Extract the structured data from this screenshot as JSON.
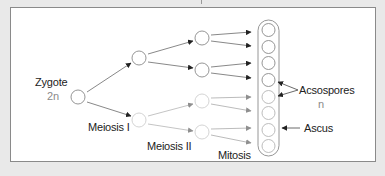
{
  "diagram": {
    "labels": {
      "zygote": "Zygote",
      "zygote_ploidy": "2n",
      "meiosis1": "Meiosis I",
      "meiosis2": "Meiosis II",
      "mitosis": "Mitosis",
      "ascospores": "Acsospores",
      "ascospores_ploidy": "n",
      "ascus": "Ascus"
    },
    "nodes": {
      "zygote": {
        "x": 78,
        "y": 97
      },
      "meiosis1": [
        {
          "x": 139,
          "y": 58
        },
        {
          "x": 139,
          "y": 120,
          "faded": true
        }
      ],
      "meiosis2": [
        {
          "x": 202,
          "y": 38
        },
        {
          "x": 202,
          "y": 70
        },
        {
          "x": 202,
          "y": 101,
          "faded": true
        },
        {
          "x": 202,
          "y": 132,
          "faded": true
        }
      ],
      "ascus_spores": 8
    },
    "colors": {
      "background": "#e9e9e9",
      "panel": "#ffffff",
      "border": "#8a8a8a",
      "dark_arrow": "#222222",
      "faded_arrow": "#8f8f8f",
      "circle_stroke": "#8a8a8a",
      "faded_circle_stroke": "#c8c8c8",
      "ploidy_text": "#8a8a8a"
    }
  }
}
